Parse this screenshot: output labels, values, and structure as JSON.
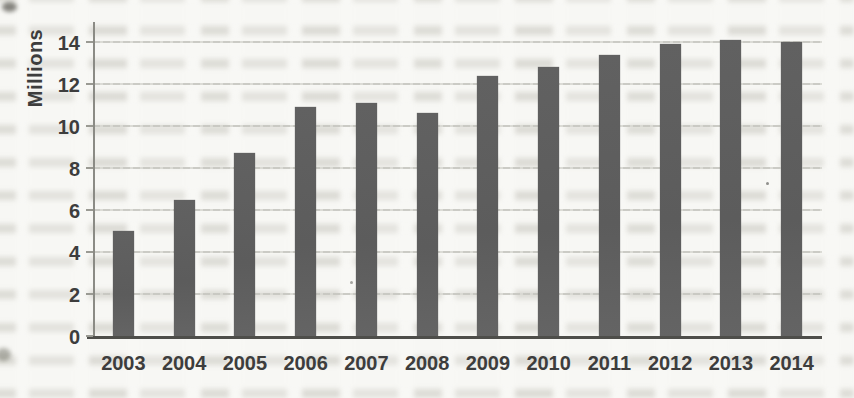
{
  "chart_data": {
    "type": "bar",
    "title": "",
    "xlabel": "",
    "ylabel": "Millions",
    "categories": [
      "2003",
      "2004",
      "2005",
      "2006",
      "2007",
      "2008",
      "2009",
      "2010",
      "2011",
      "2012",
      "2013",
      "2014"
    ],
    "values": [
      5.0,
      6.5,
      8.7,
      10.9,
      11.1,
      10.6,
      12.4,
      12.8,
      13.4,
      13.9,
      14.1,
      14.0
    ],
    "yticks": [
      0,
      2,
      4,
      6,
      8,
      10,
      12,
      14
    ],
    "ylim": [
      0,
      15
    ],
    "grid": true,
    "legend": false,
    "series_count": 1,
    "bar_color": "#5e5e5e",
    "gridline_color": "#c9c9c4",
    "axis_color": "#4e4e4a",
    "label_color": "#3d3d3d",
    "paper_color": "#f8f8f5"
  }
}
